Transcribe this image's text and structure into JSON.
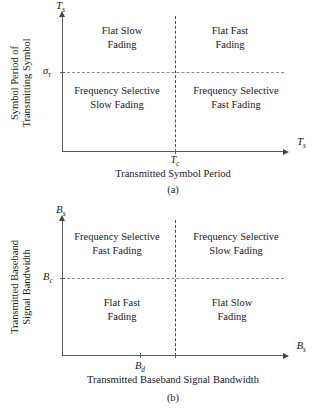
{
  "figures": [
    {
      "id": "a",
      "caption": "(a)",
      "x_axis": {
        "title": "Transmitted Symbol Period",
        "symbol_base": "T",
        "symbol_sub": "s",
        "tick_base": "T",
        "tick_sub": "c"
      },
      "y_axis": {
        "title_line1": "Symbol Period of",
        "title_line2": "Transmitting Symbol",
        "symbol_base": "T",
        "symbol_sub": "s",
        "tick_base": "σ",
        "tick_sub": "τ"
      },
      "quadrants": {
        "top_left_line1": "Flat Slow",
        "top_left_line2": "Fading",
        "top_right_line1": "Flat Fast",
        "top_right_line2": "Fading",
        "bottom_left_line1": "Frequency Selective",
        "bottom_left_line2": "Slow Fading",
        "bottom_right_line1": "Frequency Selective",
        "bottom_right_line2": "Fast Fading"
      }
    },
    {
      "id": "b",
      "caption": "(b)",
      "x_axis": {
        "title": "Transmitted Baseband Signal Bandwidth",
        "symbol_base": "B",
        "symbol_sub": "s",
        "tick_base": "B",
        "tick_sub": "d"
      },
      "y_axis": {
        "title_line1": "Transmitted Baseband",
        "title_line2": "Signal Bandwidth",
        "symbol_base": "B",
        "symbol_sub": "s",
        "tick_base": "B",
        "tick_sub": "c"
      },
      "quadrants": {
        "top_left_line1": "Frequency Selective",
        "top_left_line2": "Fast Fading",
        "top_right_line1": "Frequency Selective",
        "top_right_line2": "Slow Fading",
        "bottom_left_line1": "Flat Fast",
        "bottom_left_line2": "Fading",
        "bottom_right_line1": "Flat Slow",
        "bottom_right_line2": "Fading"
      }
    }
  ],
  "colors": {
    "background": "#ffffff",
    "ink": "#1a1a1a",
    "axis": "#5a5a5a",
    "dash_light": "#8c8c8c",
    "dash_dark": "#4a4a4a"
  }
}
